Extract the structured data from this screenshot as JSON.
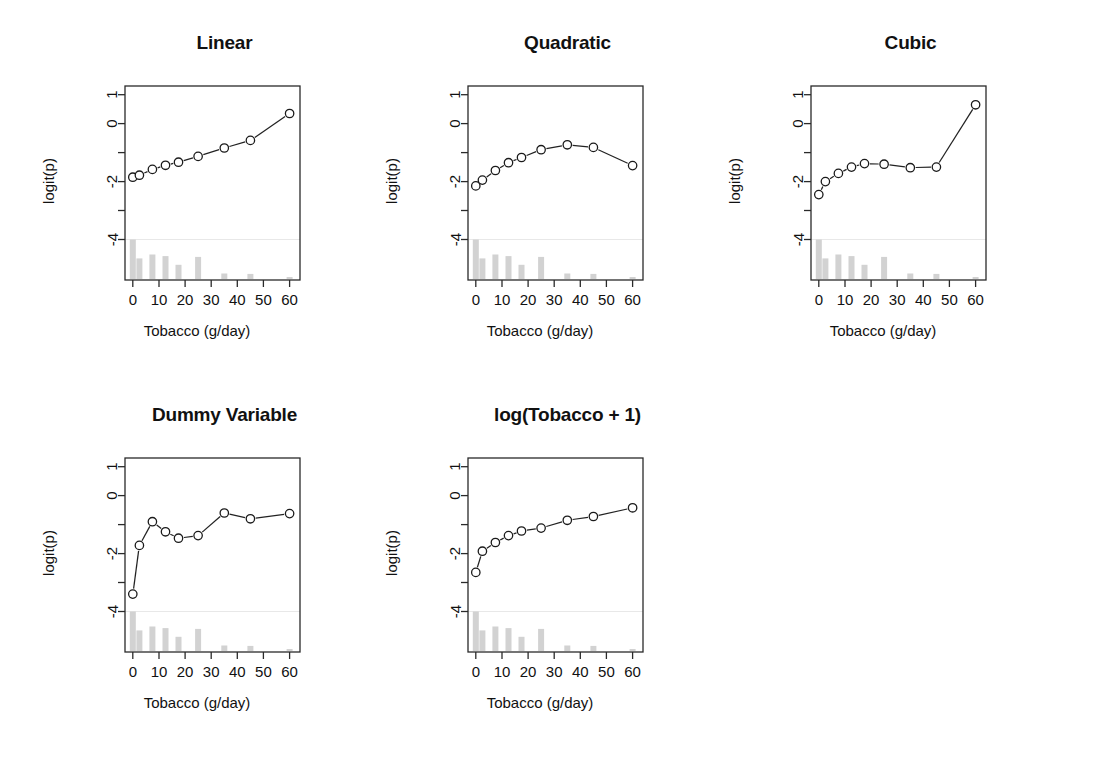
{
  "figure": {
    "width": 1095,
    "height": 778,
    "background": "#ffffff",
    "ink_color": "#111111",
    "rug_color": "#d2d2d2",
    "rug_baseline_color": "#e8e8e8",
    "n_panels": 5,
    "layout": "2 rows x 3 columns (last cell empty)"
  },
  "common": {
    "xlabel": "Tobacco (g/day)",
    "ylabel": "logit(p)",
    "x_ticks": [
      0,
      10,
      20,
      30,
      40,
      50,
      60
    ],
    "x_tick_labels": [
      "0",
      "10",
      "20",
      "30",
      "40",
      "50",
      "60"
    ],
    "y_ticks": [
      1,
      0,
      -1,
      -2,
      -3,
      -4
    ],
    "y_tick_labels": [
      "1",
      "0",
      "",
      "-2",
      "",
      "-4"
    ],
    "xlim": [
      -3,
      64
    ],
    "ylim": [
      -5.4,
      1.3
    ],
    "rug_baseline": -4.0,
    "marker": "open-circle",
    "line_style": "solid-connected",
    "grid": false,
    "legend": null
  },
  "rug": {
    "description": "light grey histogram of tobacco consumption along the bottom of each panel",
    "x": [
      0,
      2.5,
      7.5,
      12.5,
      17.5,
      25,
      35,
      45,
      60
    ],
    "counts": [
      1.0,
      0.52,
      0.62,
      0.58,
      0.36,
      0.56,
      0.14,
      0.13,
      0.05
    ],
    "bar_width": 6
  },
  "chart_data": [
    {
      "type": "line",
      "title": "Linear",
      "xlabel": "Tobacco (g/day)",
      "ylabel": "logit(p)",
      "xlim": [
        -3,
        64
      ],
      "ylim": [
        -5.4,
        1.3
      ],
      "grid": false,
      "x": [
        0,
        2.5,
        7.5,
        12.5,
        17.5,
        25,
        35,
        45,
        60
      ],
      "y": [
        -1.85,
        -1.78,
        -1.58,
        -1.44,
        -1.33,
        -1.13,
        -0.84,
        -0.58,
        0.35
      ]
    },
    {
      "type": "line",
      "title": "Quadratic",
      "xlabel": "Tobacco (g/day)",
      "ylabel": "logit(p)",
      "xlim": [
        -3,
        64
      ],
      "ylim": [
        -5.4,
        1.3
      ],
      "grid": false,
      "x": [
        0,
        2.5,
        7.5,
        12.5,
        17.5,
        25,
        35,
        45,
        60
      ],
      "y": [
        -2.15,
        -1.95,
        -1.62,
        -1.35,
        -1.17,
        -0.9,
        -0.73,
        -0.82,
        -1.45
      ]
    },
    {
      "type": "line",
      "title": "Cubic",
      "xlabel": "Tobacco (g/day)",
      "ylabel": "logit(p)",
      "xlim": [
        -3,
        64
      ],
      "ylim": [
        -5.4,
        1.3
      ],
      "grid": false,
      "x": [
        0,
        2.5,
        7.5,
        12.5,
        17.5,
        25,
        35,
        45,
        60
      ],
      "y": [
        -2.45,
        -2.0,
        -1.72,
        -1.5,
        -1.38,
        -1.4,
        -1.52,
        -1.5,
        0.65
      ]
    },
    {
      "type": "line",
      "title": "Dummy Variable",
      "xlabel": "Tobacco (g/day)",
      "ylabel": "logit(p)",
      "xlim": [
        -3,
        64
      ],
      "ylim": [
        -5.4,
        1.3
      ],
      "grid": false,
      "x": [
        0,
        2.5,
        7.5,
        12.5,
        17.5,
        25,
        35,
        45,
        60
      ],
      "y": [
        -3.4,
        -1.72,
        -0.9,
        -1.25,
        -1.47,
        -1.38,
        -0.6,
        -0.8,
        -0.62
      ]
    },
    {
      "type": "line",
      "title": "log(Tobacco + 1)",
      "xlabel": "Tobacco (g/day)",
      "ylabel": "logit(p)",
      "xlim": [
        -3,
        64
      ],
      "ylim": [
        -5.4,
        1.3
      ],
      "grid": false,
      "x": [
        0,
        2.5,
        7.5,
        12.5,
        17.5,
        25,
        35,
        45,
        60
      ],
      "y": [
        -2.65,
        -1.92,
        -1.62,
        -1.38,
        -1.22,
        -1.12,
        -0.85,
        -0.72,
        -0.42
      ]
    }
  ],
  "panel_positions": [
    {
      "left": 42,
      "top": 22
    },
    {
      "left": 385,
      "top": 22
    },
    {
      "left": 728,
      "top": 22
    },
    {
      "left": 42,
      "top": 394
    },
    {
      "left": 385,
      "top": 394
    }
  ]
}
